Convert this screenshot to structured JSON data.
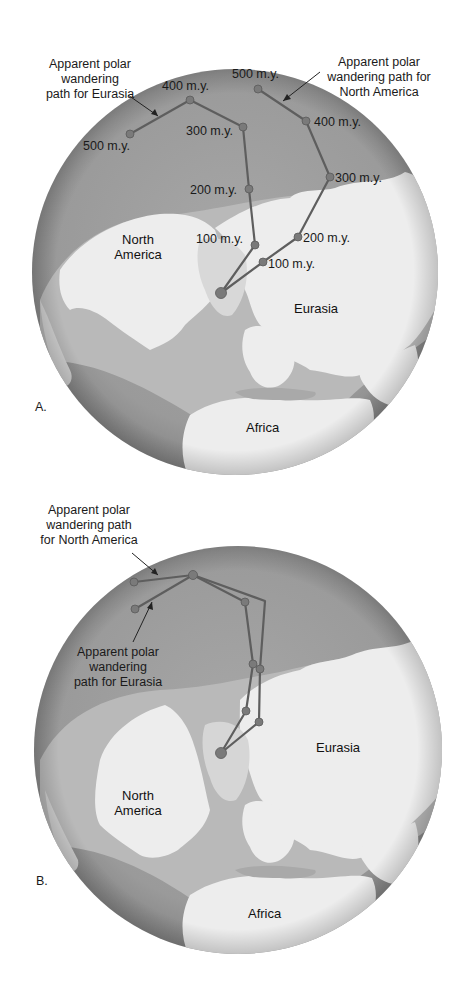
{
  "figure": {
    "panels": [
      {
        "id": "A",
        "letter": "A.",
        "globe": {
          "cx": 235,
          "cy": 272,
          "r": 203
        },
        "callouts": {
          "eurasia": [
            "Apparent polar",
            "wandering",
            "path for Eurasia"
          ],
          "north_america": [
            "Apparent polar",
            "wandering path for",
            "North America"
          ]
        },
        "continents": {
          "north_america": [
            "North",
            "America"
          ],
          "eurasia": "Eurasia",
          "africa": "Africa"
        },
        "paths": {
          "eurasia": {
            "points": [
              [
                221,
                293
              ],
              [
                255,
                245
              ],
              [
                249,
                189
              ],
              [
                243,
                127
              ],
              [
                190,
                100
              ],
              [
                130,
                134
              ]
            ],
            "labels": [
              "",
              "100 m.y.",
              "200 m.y.",
              "300 m.y.",
              "400 m.y.",
              "500 m.y."
            ]
          },
          "north_america": {
            "points": [
              [
                221,
                293
              ],
              [
                263,
                262
              ],
              [
                298,
                237
              ],
              [
                330,
                177
              ],
              [
                306,
                121
              ],
              [
                258,
                89
              ]
            ],
            "labels": [
              "",
              "100 m.y.",
              "200 m.y.",
              "300 m.y.",
              "400 m.y.",
              "500 m.y."
            ]
          }
        }
      },
      {
        "id": "B",
        "letter": "B.",
        "globe": {
          "cx": 238,
          "cy": 750,
          "r": 204
        },
        "callouts": {
          "north_america": [
            "Apparent polar",
            "wandering path",
            "for North America"
          ],
          "eurasia": [
            "Apparent polar",
            "wandering",
            "path for Eurasia"
          ]
        },
        "continents": {
          "north_america": [
            "North",
            "America"
          ],
          "eurasia": "Eurasia",
          "africa": "Africa"
        },
        "paths": {
          "eurasia": {
            "points": [
              [
                221,
                753
              ],
              [
                246,
                711
              ],
              [
                253,
                664
              ],
              [
                245,
                602
              ],
              [
                193,
                575
              ],
              [
                135,
                609
              ]
            ]
          },
          "north_america": {
            "points": [
              [
                221,
                753
              ],
              [
                259,
                722
              ],
              [
                260,
                669
              ],
              [
                265,
                601
              ],
              [
                193,
                575
              ],
              [
                134,
                582
              ]
            ]
          }
        }
      }
    ],
    "colors": {
      "ocean": "#9c9c9c",
      "ocean_edge": "#858585",
      "shelf": "#b9b9b9",
      "land": "#ededed",
      "path": "#5e5e5e",
      "dot": "#7a7a7a",
      "dot_dark": "#5a5a5a"
    }
  }
}
